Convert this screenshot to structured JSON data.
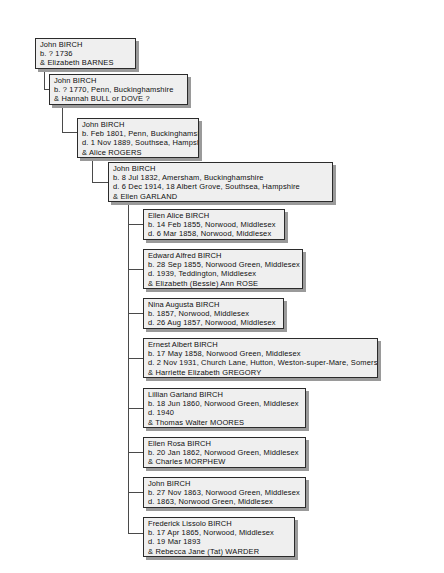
{
  "chart": {
    "type": "genealogy-descendant-tree",
    "surname_focus": "BIRCH",
    "background_color": "#ffffff",
    "box_fill_color": "#efefef",
    "box_border_color": "#2b2b2b",
    "box_shadow_color": "#9a9a9a",
    "line_color": "#4a4a4a"
  },
  "generations": [
    {
      "level": 1,
      "person": {
        "name": "John BIRCH",
        "birth": "b. ? 1736",
        "death": "",
        "spouse": "& Elizabeth BARNES",
        "lines": [
          "John BIRCH",
          "b. ? 1736",
          "& Elizabeth BARNES"
        ]
      }
    },
    {
      "level": 2,
      "person": {
        "name": "John BIRCH",
        "birth": "b. ? 1770, Penn, Buckinghamshire",
        "death": "",
        "spouse": "& Hannah BULL or DOVE ?",
        "lines": [
          "John BIRCH",
          "b. ? 1770, Penn, Buckinghamshire",
          "& Hannah BULL or DOVE ?"
        ]
      }
    },
    {
      "level": 3,
      "person": {
        "name": "John BIRCH",
        "birth": "b. Feb 1801, Penn, Buckinghamshire",
        "death": "d. 1 Nov 1889, Southsea, Hampshire",
        "spouse": "& Alice ROGERS",
        "lines": [
          "John BIRCH",
          "b. Feb 1801, Penn, Buckinghamshire",
          "d. 1 Nov 1889, Southsea, Hampshire",
          "& Alice ROGERS"
        ]
      }
    },
    {
      "level": 4,
      "person": {
        "name": "John BIRCH",
        "birth": "b. 8 Jul 1832, Amersham, Buckinghamshire",
        "death": "d. 6 Dec 1914, 18 Albert Grove, Southsea, Hampshire",
        "spouse": "& Ellen GARLAND",
        "lines": [
          "John BIRCH",
          "b. 8 Jul 1832, Amersham, Buckinghamshire",
          "d. 6 Dec 1914, 18 Albert Grove, Southsea, Hampshire",
          "& Ellen GARLAND"
        ]
      }
    }
  ],
  "children": [
    {
      "index": 1,
      "name": "Ellen Alice BIRCH",
      "birth": "b. 14 Feb 1855, Norwood, Middlesex",
      "death": "d. 6 Mar 1858, Norwood, Middlesex",
      "spouse": "",
      "lines": [
        "Ellen Alice BIRCH",
        "b. 14 Feb 1855, Norwood, Middlesex",
        "d. 6 Mar 1858, Norwood, Middlesex"
      ]
    },
    {
      "index": 2,
      "name": "Edward Alfred BIRCH",
      "birth": "b. 28 Sep 1855, Norwood Green, Middlesex",
      "death": "d. 1939, Teddington, Middlesex",
      "spouse": "& Elizabeth (Bessie) Ann ROSE",
      "lines": [
        "Edward Alfred BIRCH",
        "b. 28 Sep 1855, Norwood Green, Middlesex",
        "d. 1939, Teddington, Middlesex",
        "& Elizabeth (Bessie) Ann ROSE"
      ]
    },
    {
      "index": 3,
      "name": "Nina Augusta BIRCH",
      "birth": "b. 1857, Norwood, Middlesex",
      "death": "d. 26 Aug 1857, Norwood, Middlesex",
      "spouse": "",
      "lines": [
        "Nina Augusta BIRCH",
        "b. 1857, Norwood, Middlesex",
        "d. 26 Aug 1857, Norwood, Middlesex"
      ]
    },
    {
      "index": 4,
      "name": "Ernest Albert BIRCH",
      "birth": "b. 17 May 1858, Norwood Green, Middlesex",
      "death": "d. 2 Nov 1931, Church Lane, Hutton, Weston-super-Mare, Somerset",
      "spouse": "& Harriette Elizabeth GREGORY",
      "lines": [
        "Ernest Albert BIRCH",
        "b. 17 May 1858, Norwood Green, Middlesex",
        "d. 2 Nov 1931, Church Lane, Hutton, Weston-super-Mare, Somerset",
        "& Harriette Elizabeth GREGORY"
      ]
    },
    {
      "index": 5,
      "name": "Lillian Garland BIRCH",
      "birth": "b. 18 Jun 1860, Norwood Green, Middlesex",
      "death": "d. 1940",
      "spouse": "& Thomas Walter MOORES",
      "lines": [
        "Lillian Garland BIRCH",
        "b. 18 Jun 1860, Norwood Green, Middlesex",
        "d. 1940",
        "& Thomas Walter MOORES"
      ]
    },
    {
      "index": 6,
      "name": "Ellen Rosa BIRCH",
      "birth": "b. 20 Jan 1862, Norwood Green, Middlesex",
      "death": "",
      "spouse": "& Charles MORPHEW",
      "lines": [
        "Ellen Rosa BIRCH",
        "b. 20 Jan 1862, Norwood Green, Middlesex",
        "& Charles MORPHEW"
      ]
    },
    {
      "index": 7,
      "name": "John BIRCH",
      "birth": "b. 27 Nov 1863, Norwood Green, Middlesex",
      "death": "d. 1863, Norwood Green, Middlesex",
      "spouse": "",
      "lines": [
        "John BIRCH",
        "b. 27 Nov 1863, Norwood Green, Middlesex",
        "d. 1863, Norwood Green, Middlesex"
      ]
    },
    {
      "index": 8,
      "name": "Frederick Lissolo BIRCH",
      "birth": "b. 17 Apr 1865, Norwood, Middlesex",
      "death": "d. 19 Mar 1893",
      "spouse": "& Rebecca Jane (Tat) WARDER",
      "lines": [
        "Frederick Lissolo BIRCH",
        "b. 17 Apr 1865, Norwood, Middlesex",
        "d. 19 Mar 1893",
        "& Rebecca Jane (Tat) WARDER"
      ]
    }
  ]
}
